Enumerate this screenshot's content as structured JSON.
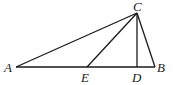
{
  "figure": {
    "type": "geometry-triangle",
    "line_color": "#1a1a1a",
    "points": {
      "A": {
        "label": "A",
        "x": 16,
        "y": 67
      },
      "B": {
        "label": "B",
        "x": 155,
        "y": 67
      },
      "C": {
        "label": "C",
        "x": 137,
        "y": 13
      },
      "D": {
        "label": "D",
        "x": 137,
        "y": 67
      },
      "E": {
        "label": "E",
        "x": 87,
        "y": 67
      }
    },
    "segments": [
      [
        "A",
        "B"
      ],
      [
        "A",
        "C"
      ],
      [
        "C",
        "B"
      ],
      [
        "C",
        "E"
      ],
      [
        "C",
        "D"
      ]
    ]
  }
}
